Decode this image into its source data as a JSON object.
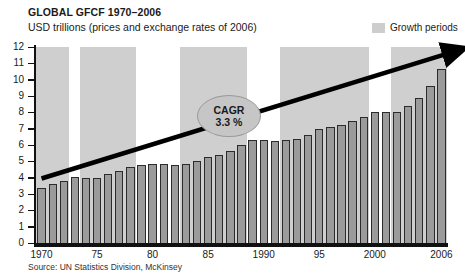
{
  "header": {
    "title": "GLOBAL GFCF 1970–2006",
    "subtitle": "USD trillions (prices and exchange rates of 2006)"
  },
  "legend": {
    "items": [
      {
        "label": "Growth periods",
        "swatch_color": "#cdcdcd"
      }
    ]
  },
  "annotation": {
    "label": "CAGR",
    "value": "3.3 %"
  },
  "footer": {
    "source": "Source: UN Statistics Division, McKinsey"
  },
  "colors": {
    "bar_fill": "#9b9b9b",
    "bar_stroke": "#2b2b2b",
    "band_fill": "#cfcfcf",
    "axis": "#111111",
    "trend_line": "#000000",
    "callout_fill": "#c6c6c6"
  },
  "chart_data": {
    "type": "bar",
    "title": "GLOBAL GFCF 1970–2006",
    "subtitle": "USD trillions (prices and exchange rates of 2006)",
    "xlabel": "",
    "ylabel": "USD trillions",
    "ylim": [
      0,
      12
    ],
    "yticks": [
      0,
      1,
      2,
      3,
      4,
      5,
      6,
      7,
      8,
      9,
      10,
      11,
      12
    ],
    "ytick_labels": [
      "0",
      "1",
      "2",
      "3",
      "4",
      "5",
      "6",
      "7",
      "8",
      "9",
      "10",
      "11",
      "12"
    ],
    "grid": false,
    "legend_position": "top-right",
    "categories": [
      1970,
      1971,
      1972,
      1973,
      1974,
      1975,
      1976,
      1977,
      1978,
      1979,
      1980,
      1981,
      1982,
      1983,
      1984,
      1985,
      1986,
      1987,
      1988,
      1989,
      1990,
      1991,
      1992,
      1993,
      1994,
      1995,
      1996,
      1997,
      1998,
      1999,
      2000,
      2001,
      2002,
      2003,
      2004,
      2005,
      2006
    ],
    "xtick_labels": [
      {
        "category": 1970,
        "label": "1970"
      },
      {
        "category": 1975,
        "label": "75"
      },
      {
        "category": 1980,
        "label": "80"
      },
      {
        "category": 1985,
        "label": "85"
      },
      {
        "category": 1990,
        "label": "1990"
      },
      {
        "category": 1995,
        "label": "95"
      },
      {
        "category": 2000,
        "label": "2000"
      },
      {
        "category": 2006,
        "label": "2006"
      }
    ],
    "values": [
      3.35,
      3.6,
      3.8,
      4.05,
      4.0,
      4.0,
      4.2,
      4.4,
      4.65,
      4.8,
      4.85,
      4.85,
      4.75,
      4.85,
      5.05,
      5.25,
      5.4,
      5.65,
      6.0,
      6.3,
      6.3,
      6.25,
      6.3,
      6.35,
      6.6,
      6.95,
      7.1,
      7.25,
      7.45,
      7.7,
      8.05,
      8.05,
      8.0,
      8.4,
      8.9,
      9.6,
      10.65
    ],
    "shaded_spans": [
      {
        "label": "Growth periods",
        "start": 1970,
        "end": 1972
      },
      {
        "label": "Growth periods",
        "start": 1974,
        "end": 1978
      },
      {
        "label": "Growth periods",
        "start": 1983,
        "end": 1988
      },
      {
        "label": "Growth periods",
        "start": 1992,
        "end": 1999
      },
      {
        "label": "Growth periods",
        "start": 2002,
        "end": 2006
      }
    ],
    "trend": {
      "type": "arrow",
      "label": "CAGR",
      "value": "3.3 %",
      "cagr_percent": 3.3,
      "start": {
        "x": 1970,
        "y": 3.95
      },
      "end": {
        "x": 2006,
        "y": 11.6
      }
    }
  }
}
